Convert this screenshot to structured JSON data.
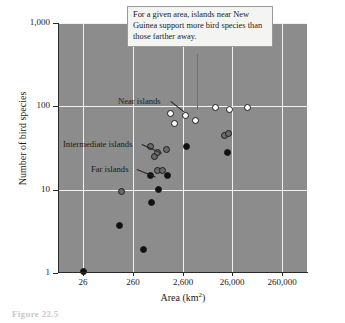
{
  "figure": {
    "caption": "Figure 22.5"
  },
  "callout": {
    "text": "For a given area, islands near New Guinea support more bird species than those farther away."
  },
  "annotations": [
    {
      "label": "Near islands",
      "x": 118,
      "y": 96,
      "lx": 171,
      "ly": 101,
      "len": 17,
      "angle": 38
    },
    {
      "label": "Intermediate islands",
      "x": 63,
      "y": 139,
      "lx": 142,
      "ly": 144,
      "len": 22,
      "angle": 24
    },
    {
      "label": "Far islands",
      "x": 91,
      "y": 164,
      "lx": 137,
      "ly": 169,
      "len": 20,
      "angle": 22
    }
  ],
  "colors": {
    "plot_background": "#8c8c8c",
    "gridline": "#f2f2f2",
    "axis": "#2a2a2a",
    "near_marker": "#fdfdfd",
    "intermediate_marker": "#6a6a6a",
    "far_marker": "#101010",
    "callout_background": "#f4f4f2"
  },
  "chart_data": {
    "type": "scatter",
    "title": "",
    "xlabel": "Area (km2)",
    "xlabel_base": "Area (km",
    "xlabel_sup": "2",
    "xlabel_tail": ")",
    "ylabel": "Number of bird species",
    "xscale": "log",
    "yscale": "log",
    "grid": true,
    "legend": "inline-annotations",
    "xlim": [
      8.2,
      820000
    ],
    "ylim": [
      1,
      1000
    ],
    "xticks": [
      26,
      260,
      2600,
      26000,
      260000
    ],
    "xtick_labels": [
      "26",
      "260",
      "2,600",
      "26,000",
      "260,000"
    ],
    "yticks": [
      1,
      10,
      100,
      1000
    ],
    "ytick_labels": [
      "1",
      "10",
      "100",
      "1,000"
    ],
    "series": [
      {
        "name": "Near islands",
        "marker": "open-circle",
        "points": [
          {
            "area": 1500,
            "species": 83
          },
          {
            "area": 1800,
            "species": 63
          },
          {
            "area": 3000,
            "species": 78
          },
          {
            "area": 4800,
            "species": 68
          },
          {
            "area": 12000,
            "species": 96
          },
          {
            "area": 23000,
            "species": 93
          },
          {
            "area": 52000,
            "species": 97
          }
        ]
      },
      {
        "name": "Intermediate islands",
        "marker": "gray-circle",
        "points": [
          {
            "area": 155,
            "species": 9.4
          },
          {
            "area": 600,
            "species": 33
          },
          {
            "area": 700,
            "species": 25
          },
          {
            "area": 800,
            "species": 28
          },
          {
            "area": 1250,
            "species": 30
          },
          {
            "area": 830,
            "species": 17
          },
          {
            "area": 1020,
            "species": 17
          },
          {
            "area": 18000,
            "species": 45
          },
          {
            "area": 22000,
            "species": 47
          }
        ]
      },
      {
        "name": "Far islands",
        "marker": "filled-circle",
        "points": [
          {
            "area": 26,
            "species": 1.05
          },
          {
            "area": 140,
            "species": 3.7
          },
          {
            "area": 420,
            "species": 1.9
          },
          {
            "area": 620,
            "species": 7.1
          },
          {
            "area": 600,
            "species": 15
          },
          {
            "area": 870,
            "species": 10
          },
          {
            "area": 1300,
            "species": 15
          },
          {
            "area": 3100,
            "species": 33
          },
          {
            "area": 21000,
            "species": 28
          }
        ]
      }
    ]
  }
}
